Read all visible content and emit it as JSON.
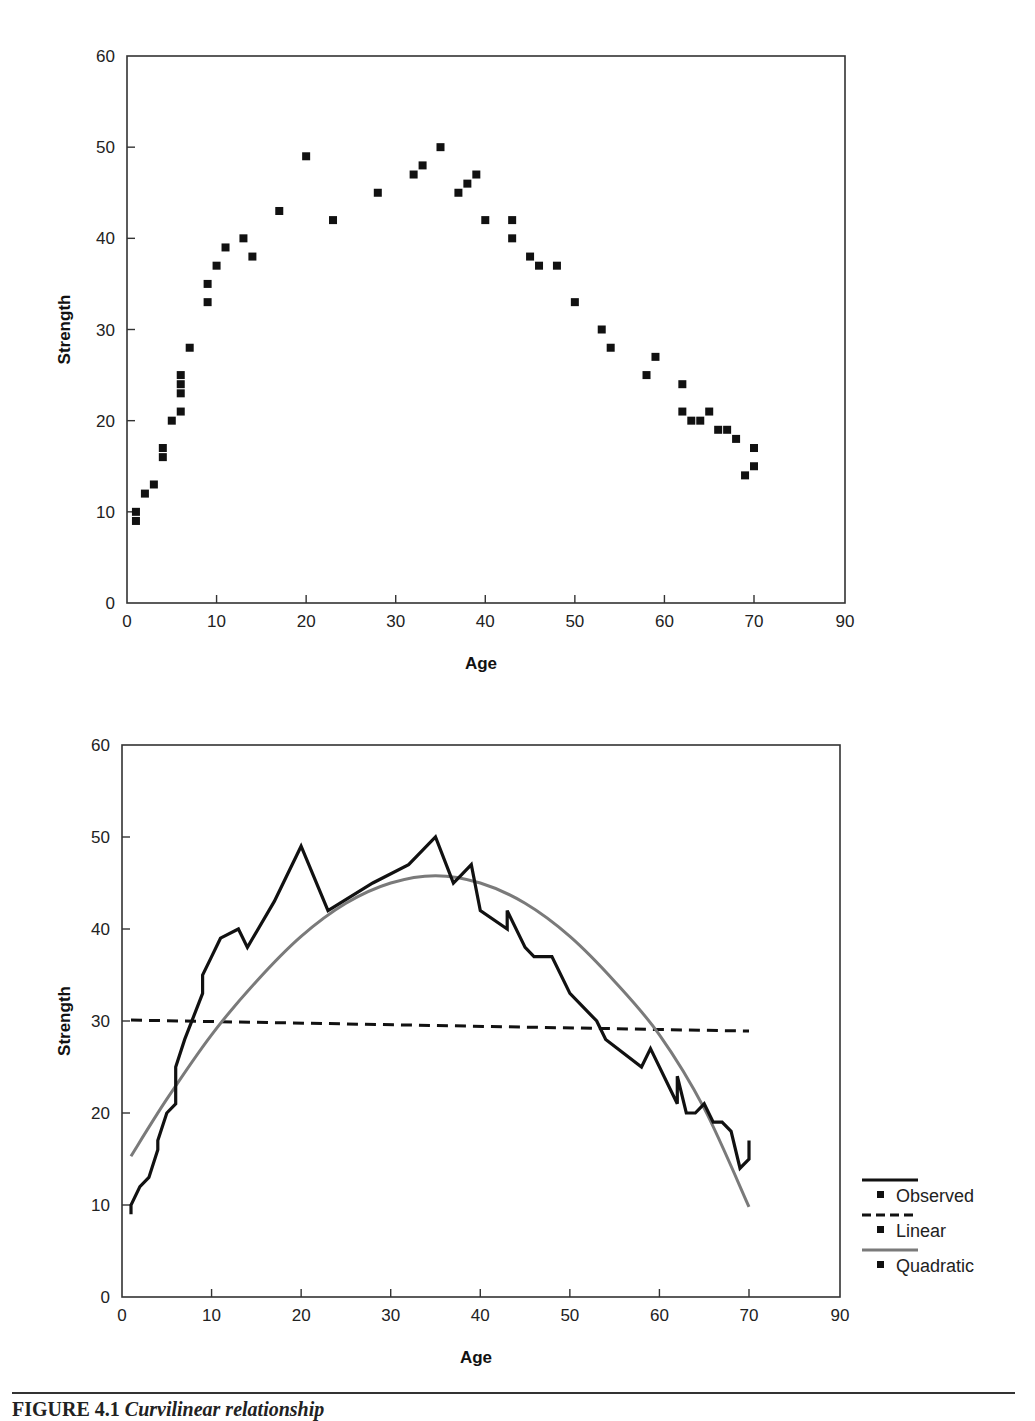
{
  "figure": {
    "caption_label": "FIGURE 4.1",
    "caption_title": "Curvilinear relationship"
  },
  "chart_data": [
    {
      "type": "scatter",
      "title": "",
      "xlabel": "Age",
      "ylabel": "Strength",
      "xlim": [
        0,
        90
      ],
      "ylim": [
        0,
        60
      ],
      "x_ticks": [
        "0",
        "10",
        "20",
        "30",
        "40",
        "50",
        "60",
        "70",
        "90"
      ],
      "y_ticks": [
        "0",
        "10",
        "20",
        "30",
        "40",
        "50",
        "60"
      ],
      "grid": false,
      "legend": null,
      "series": [
        {
          "name": "Observed",
          "marker": "square",
          "color": "#111111",
          "points": [
            [
              1,
              10
            ],
            [
              1,
              9
            ],
            [
              2,
              12
            ],
            [
              3,
              13
            ],
            [
              4,
              17
            ],
            [
              4,
              16
            ],
            [
              5,
              20
            ],
            [
              6,
              21
            ],
            [
              6,
              23
            ],
            [
              6,
              24
            ],
            [
              6,
              25
            ],
            [
              7,
              28
            ],
            [
              9,
              33
            ],
            [
              9,
              35
            ],
            [
              10,
              37
            ],
            [
              11,
              39
            ],
            [
              13,
              40
            ],
            [
              14,
              38
            ],
            [
              17,
              43
            ],
            [
              20,
              49
            ],
            [
              23,
              42
            ],
            [
              28,
              45
            ],
            [
              32,
              47
            ],
            [
              33,
              48
            ],
            [
              35,
              50
            ],
            [
              37,
              45
            ],
            [
              38,
              46
            ],
            [
              39,
              47
            ],
            [
              40,
              42
            ],
            [
              43,
              42
            ],
            [
              43,
              40
            ],
            [
              45,
              38
            ],
            [
              46,
              37
            ],
            [
              48,
              37
            ],
            [
              50,
              33
            ],
            [
              53,
              30
            ],
            [
              54,
              28
            ],
            [
              58,
              25
            ],
            [
              59,
              27
            ],
            [
              62,
              24
            ],
            [
              62,
              21
            ],
            [
              63,
              20
            ],
            [
              64,
              20
            ],
            [
              65,
              21
            ],
            [
              66,
              19
            ],
            [
              67,
              19
            ],
            [
              68,
              18
            ],
            [
              69,
              14
            ],
            [
              70,
              15
            ],
            [
              70,
              17
            ]
          ]
        }
      ]
    },
    {
      "type": "line",
      "title": "",
      "xlabel": "Age",
      "ylabel": "Strength",
      "xlim": [
        0,
        90
      ],
      "ylim": [
        0,
        60
      ],
      "x_ticks": [
        "0",
        "10",
        "20",
        "30",
        "40",
        "50",
        "60",
        "70",
        "90"
      ],
      "y_ticks": [
        "0",
        "10",
        "20",
        "30",
        "40",
        "50",
        "60"
      ],
      "grid": false,
      "legend_position": "right",
      "series": [
        {
          "name": "Observed",
          "style": "solid",
          "color": "#111111",
          "points": [
            [
              1,
              9
            ],
            [
              1,
              10
            ],
            [
              2,
              12
            ],
            [
              3,
              13
            ],
            [
              4,
              16
            ],
            [
              4,
              17
            ],
            [
              5,
              20
            ],
            [
              6,
              21
            ],
            [
              6,
              23
            ],
            [
              6,
              24
            ],
            [
              6,
              25
            ],
            [
              7,
              28
            ],
            [
              9,
              33
            ],
            [
              9,
              35
            ],
            [
              10,
              37
            ],
            [
              11,
              39
            ],
            [
              13,
              40
            ],
            [
              14,
              38
            ],
            [
              17,
              43
            ],
            [
              20,
              49
            ],
            [
              23,
              42
            ],
            [
              28,
              45
            ],
            [
              32,
              47
            ],
            [
              33,
              48
            ],
            [
              35,
              50
            ],
            [
              37,
              45
            ],
            [
              38,
              46
            ],
            [
              39,
              47
            ],
            [
              40,
              42
            ],
            [
              43,
              40
            ],
            [
              43,
              42
            ],
            [
              45,
              38
            ],
            [
              46,
              37
            ],
            [
              48,
              37
            ],
            [
              50,
              33
            ],
            [
              53,
              30
            ],
            [
              54,
              28
            ],
            [
              58,
              25
            ],
            [
              59,
              27
            ],
            [
              62,
              21
            ],
            [
              62,
              24
            ],
            [
              63,
              20
            ],
            [
              64,
              20
            ],
            [
              65,
              21
            ],
            [
              66,
              19
            ],
            [
              67,
              19
            ],
            [
              68,
              18
            ],
            [
              69,
              14
            ],
            [
              70,
              15
            ],
            [
              70,
              17
            ]
          ]
        },
        {
          "name": "Linear",
          "style": "dashed",
          "color": "#111111",
          "points": [
            [
              1,
              30.1
            ],
            [
              70,
              28.9
            ]
          ]
        },
        {
          "name": "Quadratic",
          "style": "solid",
          "color": "#7a7a7a",
          "points": [
            [
              1,
              15.3
            ],
            [
              5,
              21.5
            ],
            [
              10,
              28.5
            ],
            [
              15,
              34.3
            ],
            [
              20,
              39.2
            ],
            [
              25,
              42.8
            ],
            [
              30,
              45.0
            ],
            [
              35,
              45.8
            ],
            [
              40,
              45.0
            ],
            [
              45,
              42.8
            ],
            [
              50,
              39.2
            ],
            [
              55,
              34.3
            ],
            [
              60,
              28.5
            ],
            [
              65,
              20.5
            ],
            [
              70,
              9.8
            ]
          ]
        }
      ],
      "legend": [
        {
          "label": "Observed",
          "style": "solid",
          "color": "#111111"
        },
        {
          "label": "Linear",
          "style": "dashed",
          "color": "#111111"
        },
        {
          "label": "Quadratic",
          "style": "solid",
          "color": "#7a7a7a"
        }
      ]
    }
  ]
}
